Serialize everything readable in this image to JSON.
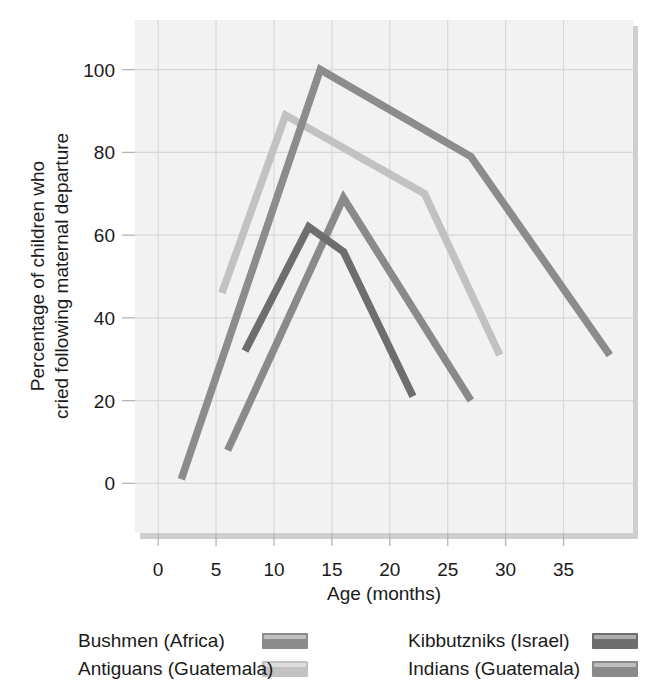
{
  "chart_data": {
    "type": "line",
    "title": "",
    "xlabel": "Age (months)",
    "ylabel": "Percentage of children who cried following maternal departure",
    "ylabel_line1": "Percentage of children who",
    "ylabel_line2": "cried following maternal departure",
    "xlim": [
      -2,
      41
    ],
    "ylim": [
      -12,
      112
    ],
    "xticks": [
      0,
      5,
      10,
      15,
      20,
      25,
      30,
      35
    ],
    "yticks": [
      0,
      20,
      40,
      60,
      80,
      100
    ],
    "xtick_labels": [
      "0",
      "5",
      "10",
      "15",
      "20",
      "25",
      "30",
      "35"
    ],
    "ytick_labels": [
      "0",
      "20",
      "40",
      "60",
      "80",
      "100"
    ],
    "grid": true,
    "legend_position": "below",
    "series": [
      {
        "name": "Bushmen (Africa)",
        "color": "#8c8c8c",
        "points": [
          [
            2,
            1
          ],
          [
            14,
            100
          ],
          [
            27,
            79
          ],
          [
            39,
            31
          ]
        ]
      },
      {
        "name": "Antiguans (Guatemala)",
        "color": "#c2c2c2",
        "points": [
          [
            5.5,
            46
          ],
          [
            11,
            89
          ],
          [
            23,
            70
          ],
          [
            29.5,
            31
          ]
        ]
      },
      {
        "name": "Kibbutzniks (Israel)",
        "color": "#6e6e6e",
        "points": [
          [
            7.5,
            32
          ],
          [
            13,
            62
          ],
          [
            16,
            56
          ],
          [
            22,
            21
          ]
        ]
      },
      {
        "name": "Indians (Guatemala)",
        "color": "#8a8a8a",
        "points": [
          [
            6,
            8
          ],
          [
            16,
            69
          ],
          [
            27,
            20
          ]
        ]
      }
    ]
  },
  "legend": {
    "entries": [
      {
        "label": "Bushmen (Africa)",
        "color": "#8c8c8c",
        "column": 0,
        "row": 0
      },
      {
        "label": "Antiguans (Guatemala)",
        "color": "#c2c2c2",
        "column": 0,
        "row": 1
      },
      {
        "label": "Kibbutzniks (Israel)",
        "color": "#6e6e6e",
        "column": 1,
        "row": 0
      },
      {
        "label": "Indians (Guatemala)",
        "color": "#8a8a8a",
        "column": 1,
        "row": 1
      }
    ]
  },
  "colors": {
    "plot_background": "#f2f2f2",
    "gridline": "#d8d8d8",
    "text": "#1a1a1a",
    "shadow": "#cfcfcf"
  }
}
